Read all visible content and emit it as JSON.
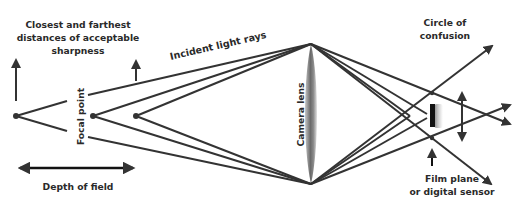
{
  "diagram": {
    "labels": {
      "sharpness": "Closest and farthest distances of acceptable sharpness",
      "sharpness_lines": [
        "Closest and farthest",
        "distances of acceptable",
        "sharpness"
      ],
      "incident": "Incident light rays",
      "focal_point": "Focal point",
      "lens": "Camera lens",
      "coc_lines": [
        "Circle of",
        "confusion"
      ],
      "depth_of_field": "Depth of field",
      "film_lines": [
        "Film plane",
        "or digital sensor"
      ]
    },
    "icons": {
      "object_points": "dot-icon",
      "arrows": "arrow-icon",
      "lens": "biconvex-lens-icon",
      "sensor": "sensor-bar-icon"
    },
    "colors": {
      "line": "#333333",
      "text": "#2a2a2a",
      "lens_dark": "#5a5a5a",
      "lens_light": "#d6d6d6",
      "background": "#ffffff"
    }
  }
}
